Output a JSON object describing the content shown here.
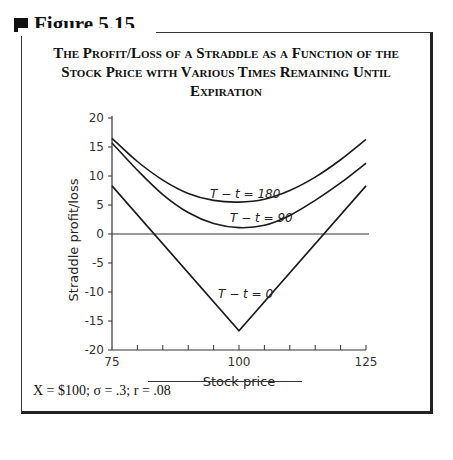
{
  "figure": {
    "label": "Figure 5.15",
    "caption": "The Profit/Loss of a Straddle as a Function of the Stock Price with Various Times Remaining Until Expiration",
    "note": "X = $100; σ = .3; r = .08"
  },
  "chart_data": {
    "type": "line",
    "title": "The Profit/Loss of a Straddle as a Function of the Stock Price with Various Times Remaining Until Expiration",
    "xlabel": "Stock price",
    "ylabel": "Straddle profit/loss",
    "xlim": [
      75,
      125
    ],
    "ylim": [
      -20,
      20
    ],
    "x_ticks": [
      75,
      100,
      125
    ],
    "y_ticks": [
      20,
      15,
      10,
      5,
      0,
      -5,
      -10,
      -15,
      -20
    ],
    "grid": false,
    "legend": "inline labels",
    "x": [
      75,
      80,
      85,
      90,
      95,
      100,
      105,
      110,
      115,
      120,
      125
    ],
    "series": [
      {
        "name": "T − t = 180",
        "values": [
          16.5,
          12.5,
          9.3,
          7.0,
          5.8,
          5.5,
          6.0,
          7.5,
          9.8,
          12.8,
          16.3
        ]
      },
      {
        "name": "T − t = 90",
        "values": [
          15.7,
          11.0,
          6.8,
          3.7,
          1.8,
          1.1,
          1.5,
          3.2,
          5.8,
          8.8,
          12.2
        ]
      },
      {
        "name": "T − t = 0",
        "values": [
          8.3,
          3.3,
          -1.7,
          -6.7,
          -11.7,
          -16.7,
          -11.7,
          -6.7,
          -1.7,
          3.3,
          8.3
        ]
      }
    ],
    "annotations": [
      "T − t = 180",
      "T − t = 90",
      "T − t = 0"
    ]
  }
}
